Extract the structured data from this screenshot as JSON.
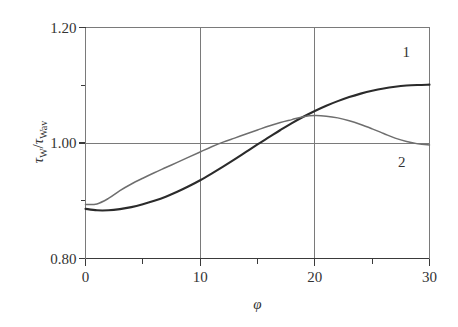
{
  "chart_data": {
    "type": "line",
    "title": "",
    "subtitle": "",
    "xlabel": "φ",
    "ylabel": "τW/τWav",
    "ylabel_parts": {
      "numerator_symbol": "τ",
      "numerator_sub": "W",
      "separator": "/",
      "denominator_symbol": "τ",
      "denominator_sub": "Wav"
    },
    "xlim": [
      0,
      30
    ],
    "ylim": [
      0.8,
      1.2
    ],
    "grid": true,
    "grid_axes": "both",
    "gridlines_x": [
      10,
      20
    ],
    "gridlines_y": [
      1.0,
      1.2
    ],
    "legend": "inline-curve-labels",
    "legend_position": "right-inside",
    "x_major_ticks": [
      0,
      10,
      20,
      30
    ],
    "x_major_tick_labels": [
      "0",
      "10",
      "20",
      "30"
    ],
    "x_minor_ticks": [
      5,
      15,
      25
    ],
    "y_major_ticks": [
      0.8,
      1.0,
      1.2
    ],
    "y_major_tick_labels": [
      "0.80",
      "1.00",
      "1.20"
    ],
    "y_minor_ticks": [
      0.9,
      1.1
    ],
    "series": [
      {
        "name": "1",
        "label": "1",
        "color": "#2b2b2b",
        "width": 2.1,
        "x": [
          0,
          1,
          2,
          3,
          4,
          5,
          6,
          7,
          8,
          9,
          10,
          11,
          12,
          13,
          14,
          15,
          16,
          17,
          18,
          19,
          20,
          21,
          22,
          23,
          24,
          25,
          26,
          27,
          28,
          29,
          30
        ],
        "values": [
          0.886,
          0.8835,
          0.8835,
          0.8855,
          0.889,
          0.894,
          0.9,
          0.907,
          0.9155,
          0.925,
          0.9355,
          0.947,
          0.959,
          0.9715,
          0.9845,
          0.9975,
          1.01,
          1.0225,
          1.0345,
          1.0455,
          1.0555,
          1.0645,
          1.0725,
          1.0795,
          1.0855,
          1.0905,
          1.0945,
          1.0975,
          1.0995,
          1.1005,
          1.101
        ]
      },
      {
        "name": "2",
        "label": "2",
        "color": "#6e6e6e",
        "width": 1.5,
        "x": [
          0,
          1,
          2,
          3,
          4,
          5,
          6,
          7,
          8,
          9,
          10,
          11,
          12,
          13,
          14,
          15,
          16,
          17,
          18,
          19,
          20,
          21,
          22,
          23,
          24,
          25,
          26,
          27,
          28,
          29,
          30
        ],
        "values": [
          0.8935,
          0.8945,
          0.904,
          0.9175,
          0.929,
          0.939,
          0.9485,
          0.9575,
          0.9665,
          0.9755,
          0.9845,
          0.9935,
          1.0015,
          1.0085,
          1.0155,
          1.0225,
          1.0295,
          1.0355,
          1.0405,
          1.0455,
          1.0475,
          1.0465,
          1.0435,
          1.0385,
          1.032,
          1.0245,
          1.0165,
          1.0085,
          1.0025,
          0.9985,
          0.9965
        ]
      }
    ],
    "annotations": [
      {
        "text": "1",
        "x": 28.0,
        "y": 1.155,
        "name": "curve-1-label"
      },
      {
        "text": "2",
        "x": 27.6,
        "y": 0.965,
        "name": "curve-2-label"
      }
    ],
    "colors": {
      "axis": "#3a3a3a",
      "grid": "#7a7a7a",
      "text": "#333333",
      "background": "#ffffff",
      "series_1": "#2b2b2b",
      "series_2": "#6e6e6e"
    }
  }
}
